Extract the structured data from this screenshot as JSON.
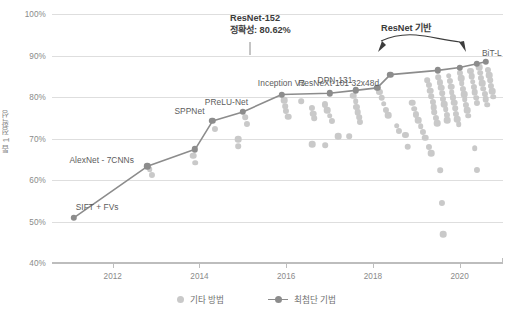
{
  "chart_data": {
    "type": "scatter",
    "title": "",
    "xlabel": "",
    "ylabel": "톱 1 정확성",
    "xlim": [
      2010.6,
      2021.0
    ],
    "ylim": [
      40,
      100
    ],
    "grid": true,
    "legend_position": "bottom-center",
    "ytick_labels": [
      "100%",
      "90%",
      "80%",
      "70%",
      "60%",
      "50%",
      "40%"
    ],
    "ytick_values": [
      100,
      90,
      80,
      70,
      60,
      50,
      40
    ],
    "xtick_labels": [
      "2012",
      "2014",
      "2016",
      "2018",
      "2020"
    ],
    "xtick_values": [
      2012,
      2014,
      2016,
      2018,
      2020
    ],
    "series": [
      {
        "name": "최첨단 기법",
        "color": "#8c8c8c",
        "type": "line+markers",
        "points": [
          {
            "x": 2011.1,
            "y": 50.9,
            "label": "SIFT + FVs",
            "label_pos": "above-right"
          },
          {
            "x": 2012.8,
            "y": 63.3,
            "label": "AlexNet - 7CNNs",
            "label_pos": "left"
          },
          {
            "x": 2013.9,
            "y": 67.4,
            "label": "",
            "label_pos": ""
          },
          {
            "x": 2014.3,
            "y": 74.2,
            "label": "SPPNet",
            "label_pos": "above-left"
          },
          {
            "x": 2015.0,
            "y": 76.4,
            "label": "PReLU-Net",
            "label_pos": "above-left"
          },
          {
            "x": 2015.9,
            "y": 80.6,
            "label": "Inception V3",
            "label_pos": "above"
          },
          {
            "x": 2017.0,
            "y": 80.9,
            "label": "",
            "label_pos": ""
          },
          {
            "x": 2017.6,
            "y": 81.6,
            "label": "DPN-131",
            "label_pos": "above-left"
          },
          {
            "x": 2018.1,
            "y": 82.2,
            "label": "",
            "label_pos": ""
          },
          {
            "x": 2018.4,
            "y": 85.4,
            "label": "ResNeXt-101 32x48d",
            "label_pos": "below-left"
          },
          {
            "x": 2019.5,
            "y": 86.4,
            "label": "",
            "label_pos": ""
          },
          {
            "x": 2020.0,
            "y": 87.1,
            "label": "",
            "label_pos": ""
          },
          {
            "x": 2020.4,
            "y": 88.0,
            "label": "BiT-L",
            "label_pos": "right"
          },
          {
            "x": 2020.6,
            "y": 88.5,
            "label": "",
            "label_pos": ""
          }
        ]
      },
      {
        "name": "기타 방법",
        "color": "#c9c9c9",
        "type": "scatter",
        "points": [
          {
            "x": 2012.85,
            "y": 62.6
          },
          {
            "x": 2012.9,
            "y": 61.3
          },
          {
            "x": 2013.85,
            "y": 65.9
          },
          {
            "x": 2013.9,
            "y": 64.2
          },
          {
            "x": 2014.35,
            "y": 72.3
          },
          {
            "x": 2014.9,
            "y": 69.8
          },
          {
            "x": 2015.05,
            "y": 75.1
          },
          {
            "x": 2015.1,
            "y": 73.6
          },
          {
            "x": 2015.95,
            "y": 79.2
          },
          {
            "x": 2015.98,
            "y": 77.8
          },
          {
            "x": 2016.0,
            "y": 76.6
          },
          {
            "x": 2016.05,
            "y": 75.3
          },
          {
            "x": 2016.35,
            "y": 79.0
          },
          {
            "x": 2016.6,
            "y": 77.4
          },
          {
            "x": 2016.62,
            "y": 76.0
          },
          {
            "x": 2016.65,
            "y": 74.9
          },
          {
            "x": 2016.9,
            "y": 78.2
          },
          {
            "x": 2016.95,
            "y": 76.8
          },
          {
            "x": 2017.0,
            "y": 75.5
          },
          {
            "x": 2017.05,
            "y": 74.3
          },
          {
            "x": 2017.55,
            "y": 80.3
          },
          {
            "x": 2017.6,
            "y": 79.0
          },
          {
            "x": 2017.62,
            "y": 77.7
          },
          {
            "x": 2017.65,
            "y": 76.4
          },
          {
            "x": 2017.68,
            "y": 75.1
          },
          {
            "x": 2017.7,
            "y": 73.9
          },
          {
            "x": 2017.2,
            "y": 70.6
          },
          {
            "x": 2017.45,
            "y": 70.5
          },
          {
            "x": 2018.15,
            "y": 81.2
          },
          {
            "x": 2018.2,
            "y": 79.8
          },
          {
            "x": 2018.25,
            "y": 78.4
          },
          {
            "x": 2018.3,
            "y": 76.9
          },
          {
            "x": 2018.35,
            "y": 75.6
          },
          {
            "x": 2018.55,
            "y": 73.1
          },
          {
            "x": 2018.6,
            "y": 71.9
          },
          {
            "x": 2018.9,
            "y": 78.6
          },
          {
            "x": 2018.95,
            "y": 77.2
          },
          {
            "x": 2019.0,
            "y": 75.8
          },
          {
            "x": 2019.05,
            "y": 74.4
          },
          {
            "x": 2019.1,
            "y": 73.0
          },
          {
            "x": 2019.15,
            "y": 71.6
          },
          {
            "x": 2019.2,
            "y": 70.2
          },
          {
            "x": 2019.25,
            "y": 84.0
          },
          {
            "x": 2019.3,
            "y": 82.8
          },
          {
            "x": 2019.32,
            "y": 81.5
          },
          {
            "x": 2019.35,
            "y": 80.2
          },
          {
            "x": 2019.38,
            "y": 78.9
          },
          {
            "x": 2019.4,
            "y": 77.6
          },
          {
            "x": 2019.42,
            "y": 76.3
          },
          {
            "x": 2019.45,
            "y": 75.0
          },
          {
            "x": 2019.48,
            "y": 73.7
          },
          {
            "x": 2019.5,
            "y": 84.8
          },
          {
            "x": 2019.55,
            "y": 83.5
          },
          {
            "x": 2019.58,
            "y": 82.2
          },
          {
            "x": 2019.6,
            "y": 80.9
          },
          {
            "x": 2019.62,
            "y": 79.6
          },
          {
            "x": 2019.65,
            "y": 78.3
          },
          {
            "x": 2019.68,
            "y": 77.0
          },
          {
            "x": 2019.7,
            "y": 75.7
          },
          {
            "x": 2019.72,
            "y": 74.4
          },
          {
            "x": 2019.75,
            "y": 85.1
          },
          {
            "x": 2019.78,
            "y": 83.8
          },
          {
            "x": 2019.8,
            "y": 82.5
          },
          {
            "x": 2019.82,
            "y": 81.2
          },
          {
            "x": 2019.85,
            "y": 79.9
          },
          {
            "x": 2019.88,
            "y": 78.6
          },
          {
            "x": 2019.9,
            "y": 77.3
          },
          {
            "x": 2019.92,
            "y": 76.0
          },
          {
            "x": 2019.95,
            "y": 74.7
          },
          {
            "x": 2019.98,
            "y": 73.4
          },
          {
            "x": 2020.0,
            "y": 85.9
          },
          {
            "x": 2020.03,
            "y": 84.6
          },
          {
            "x": 2020.05,
            "y": 83.3
          },
          {
            "x": 2020.08,
            "y": 82.0
          },
          {
            "x": 2020.1,
            "y": 80.7
          },
          {
            "x": 2020.12,
            "y": 79.4
          },
          {
            "x": 2020.15,
            "y": 78.1
          },
          {
            "x": 2020.18,
            "y": 76.8
          },
          {
            "x": 2020.2,
            "y": 75.5
          },
          {
            "x": 2020.25,
            "y": 86.3
          },
          {
            "x": 2020.28,
            "y": 85.0
          },
          {
            "x": 2020.3,
            "y": 83.7
          },
          {
            "x": 2020.32,
            "y": 82.4
          },
          {
            "x": 2020.35,
            "y": 81.1
          },
          {
            "x": 2020.38,
            "y": 79.8
          },
          {
            "x": 2020.4,
            "y": 78.5
          },
          {
            "x": 2020.45,
            "y": 87.2
          },
          {
            "x": 2020.48,
            "y": 85.9
          },
          {
            "x": 2020.5,
            "y": 84.6
          },
          {
            "x": 2020.52,
            "y": 83.3
          },
          {
            "x": 2020.55,
            "y": 82.0
          },
          {
            "x": 2020.58,
            "y": 80.7
          },
          {
            "x": 2020.6,
            "y": 79.4
          },
          {
            "x": 2020.63,
            "y": 78.1
          },
          {
            "x": 2020.65,
            "y": 86.6
          },
          {
            "x": 2020.68,
            "y": 85.3
          },
          {
            "x": 2020.7,
            "y": 84.0
          },
          {
            "x": 2020.72,
            "y": 82.7
          },
          {
            "x": 2020.75,
            "y": 81.4
          },
          {
            "x": 2020.78,
            "y": 80.1
          },
          {
            "x": 2019.3,
            "y": 67.9
          },
          {
            "x": 2019.35,
            "y": 66.5
          },
          {
            "x": 2019.55,
            "y": 62.3
          },
          {
            "x": 2019.6,
            "y": 54.4
          },
          {
            "x": 2019.62,
            "y": 47.0
          },
          {
            "x": 2020.35,
            "y": 67.7
          },
          {
            "x": 2020.4,
            "y": 62.5
          },
          {
            "x": 2016.6,
            "y": 68.6
          },
          {
            "x": 2016.9,
            "y": 68.4
          },
          {
            "x": 2018.75,
            "y": 70.9
          },
          {
            "x": 2018.8,
            "y": 68.0
          },
          {
            "x": 2014.9,
            "y": 68.2
          }
        ]
      }
    ],
    "annotations": [
      {
        "id": "resnet152",
        "lines": [
          "ResNet-152",
          "정확성: 80.62%"
        ],
        "target_x": 2015.9,
        "target_y": 80.6
      },
      {
        "id": "resnet-based",
        "lines": [
          "ResNet 기반"
        ],
        "targets": [
          "ResNeXt-101 32x48d",
          "BiT-L"
        ]
      }
    ]
  },
  "legend": {
    "items": [
      {
        "label": "기타 방법",
        "icon": "circle-marker-icon",
        "color": "#c9c9c9"
      },
      {
        "label": "최첨단 기법",
        "icon": "line-marker-icon",
        "color": "#8c8c8c"
      }
    ]
  },
  "colors": {
    "other_methods": "#c9c9c9",
    "sota": "#8c8c8c",
    "gridline": "#dedede",
    "axis": "#bdbdbd",
    "tick_text": "#8a8a8a",
    "point_label": "#5c5c5c",
    "annotation": "#3c3c3c",
    "background": "#ffffff"
  }
}
